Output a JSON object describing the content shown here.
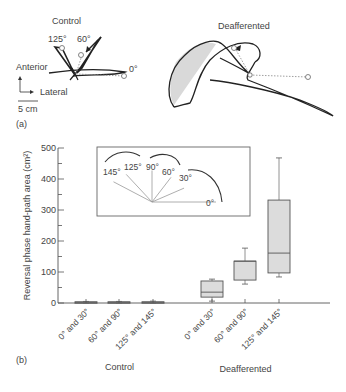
{
  "panel_a": {
    "label": "(a)",
    "control_title": "Control",
    "deafferented_title": "Deafferented",
    "angle_labels": [
      "125°",
      "60°",
      "0°"
    ],
    "axis_anterior": "Anterior",
    "axis_lateral": "Lateral",
    "scale_bar": "5 cm"
  },
  "panel_b": {
    "label": "(b)"
  },
  "chart_data": {
    "type": "box",
    "title": "",
    "ylabel": "Reversal phase hand-path area (cm²)",
    "ylim": [
      0,
      500
    ],
    "yticks": [
      0,
      100,
      200,
      300,
      400,
      500
    ],
    "groups": [
      {
        "name": "Control",
        "categories": [
          "0° and 30°",
          "60° and 90°",
          "125° and 145°"
        ],
        "boxes": [
          {
            "min": 0,
            "q1": 1,
            "median": 2,
            "q3": 4,
            "max": 5
          },
          {
            "min": 0,
            "q1": 1,
            "median": 2,
            "q3": 4,
            "max": 5
          },
          {
            "min": 0,
            "q1": 1,
            "median": 2,
            "q3": 4,
            "max": 6
          }
        ]
      },
      {
        "name": "Deafferented",
        "categories": [
          "0° and 30°",
          "60° and 90°",
          "125° and 145°"
        ],
        "boxes": [
          {
            "min": 6,
            "q1": 19,
            "median": 35,
            "q3": 71,
            "max": 77
          },
          {
            "min": 61,
            "q1": 74,
            "median": 135,
            "q3": 135,
            "max": 177
          },
          {
            "min": 84,
            "q1": 97,
            "median": 161,
            "q3": 332,
            "max": 468
          }
        ]
      }
    ],
    "inset": {
      "angle_labels": [
        "145°",
        "125°",
        "90°",
        "60°",
        "30°",
        "0°"
      ],
      "angles_deg": [
        145,
        125,
        90,
        60,
        30,
        0
      ]
    },
    "colors": {
      "box_fill": "#dcdcdc",
      "stroke": "#555555"
    }
  }
}
